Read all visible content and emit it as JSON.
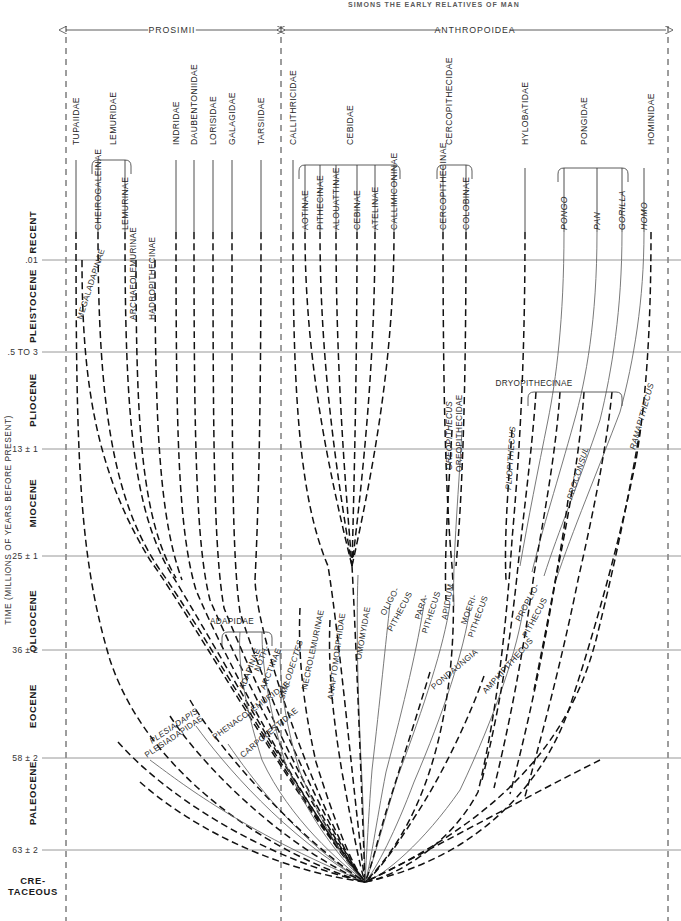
{
  "figure": {
    "running_head": "SIMONS  THE EARLY RELATIVES OF MAN",
    "axis_title": "TIME (MILLIONS OF YEARS BEFORE PRESENT)",
    "accent_color": "#1a1a1a",
    "extant_line_color": "#3a3a3a",
    "fossil_line_color": "#111111",
    "rule_color": "#8d8d8d"
  },
  "suborders": [
    {
      "name": "suborder-prosimii",
      "label": "PROSIMII",
      "x_start": 66,
      "x_end": 278,
      "label_x": 172
    },
    {
      "name": "suborder-anthropoidea",
      "label": "ANTHROPOIDEA",
      "x_start": 284,
      "x_end": 666,
      "label_x": 475
    }
  ],
  "epochs": [
    {
      "label": "RECENT",
      "y_top": 232,
      "y_bottom": 260,
      "text_y": 232
    },
    {
      "label": "PLEISTOCENE",
      "y_top": 260,
      "y_bottom": 352,
      "text_y": 306
    },
    {
      "label": "PLIOCENE",
      "y_top": 352,
      "y_bottom": 449,
      "text_y": 400
    },
    {
      "label": "MIOCENE",
      "y_top": 449,
      "y_bottom": 556,
      "text_y": 503
    },
    {
      "label": "OLIGOCENE",
      "y_top": 556,
      "y_bottom": 650,
      "text_y": 621
    },
    {
      "label": "EOCENE",
      "y_top": 650,
      "y_bottom": 758,
      "text_y": 706
    },
    {
      "label": "PALEOCENE",
      "y_top": 758,
      "y_bottom": 850,
      "text_y": 793
    },
    {
      "label": "CRE-\nTACEOUS",
      "y_top": 850,
      "y_bottom": 921,
      "text_y": 884
    }
  ],
  "ticks": [
    {
      "label": ".01",
      "y": 260
    },
    {
      "label": ".5 TO 3",
      "y": 352
    },
    {
      "label": "13 ± 1",
      "y": 449
    },
    {
      "label": "25 ± 1",
      "y": 556
    },
    {
      "label": "36 ± 2",
      "y": 650
    },
    {
      "label": "58 ± 2",
      "y": 758
    },
    {
      "label": "63 ± 2",
      "y": 850
    }
  ],
  "families": [
    {
      "label": "TUPAIIDAE",
      "x": 76,
      "text_y": 145,
      "line_y1": 232,
      "line_y2": 232
    },
    {
      "label": "LEMURIDAE",
      "x": 113,
      "text_y": 145
    },
    {
      "label": "INDRIDAE",
      "x": 176,
      "text_y": 145
    },
    {
      "label": "DAUBENTONIIDAE",
      "x": 194,
      "text_y": 145
    },
    {
      "label": "LORISIDAE",
      "x": 213,
      "text_y": 145
    },
    {
      "label": "GALAGIDAE",
      "x": 232,
      "text_y": 145
    },
    {
      "label": "TARSIIDAE",
      "x": 261,
      "text_y": 145
    },
    {
      "label": "CALLITHRICIDAE",
      "x": 293,
      "text_y": 145
    },
    {
      "label": "CEBIDAE",
      "x": 350,
      "text_y": 145
    },
    {
      "label": "CERCOPITHECIDAE",
      "x": 449,
      "text_y": 145
    },
    {
      "label": "HYLOBATIDAE",
      "x": 525,
      "text_y": 145
    },
    {
      "label": "PONGIDAE",
      "x": 584,
      "text_y": 145
    },
    {
      "label": "HOMINIDAE",
      "x": 651,
      "text_y": 145
    }
  ],
  "subfamilies": [
    {
      "label": "CHEIROGALEINAE",
      "x": 98,
      "text_y": 232,
      "top": 160
    },
    {
      "label": "LEMURINAE",
      "x": 125,
      "text_y": 232,
      "top": 160
    },
    {
      "label": "AOTINAE",
      "x": 305,
      "text_y": 232,
      "top": 165
    },
    {
      "label": "PITHECINAE",
      "x": 320,
      "text_y": 232,
      "top": 165
    },
    {
      "label": "ALOUATTINAE",
      "x": 336,
      "text_y": 232,
      "top": 165
    },
    {
      "label": "CEBINAE",
      "x": 357,
      "text_y": 232,
      "top": 165
    },
    {
      "label": "ATELINAE",
      "x": 375,
      "text_y": 232,
      "top": 165
    },
    {
      "label": "CALLIMICONINAE",
      "x": 394,
      "text_y": 232,
      "top": 165
    },
    {
      "label": "CERCOPITHECINAE",
      "x": 443,
      "text_y": 232,
      "top": 165
    },
    {
      "label": "COLOBINAE",
      "x": 466,
      "text_y": 232,
      "top": 165
    }
  ],
  "genera": [
    {
      "label": "PONGO",
      "x": 564,
      "text_y": 232,
      "top": 168
    },
    {
      "label": "PAN",
      "x": 597,
      "text_y": 232,
      "top": 168
    },
    {
      "label": "GORILLA",
      "x": 622,
      "text_y": 232,
      "top": 168
    },
    {
      "label": "HOMO",
      "x": 644,
      "text_y": 232,
      "top": 168
    }
  ],
  "fossil_taxa": [
    {
      "label": "MEGALADAPINAE",
      "italic": false,
      "x": 82,
      "y": 320,
      "rotate": -72
    },
    {
      "label": "ARCHAEOLEMURINAE",
      "italic": false,
      "x": 136,
      "y": 320,
      "rotate": -90
    },
    {
      "label": "HADROPITHECINAE",
      "italic": false,
      "x": 155,
      "y": 320,
      "rotate": -90
    },
    {
      "label": "ADAPIDAE",
      "italic": false,
      "x": 232,
      "y": 624,
      "rotate": 0
    },
    {
      "label": "ADAPINAE",
      "italic": false,
      "x": 244,
      "y": 690,
      "rotate": -68
    },
    {
      "label": "NOTH-",
      "italic": false,
      "x": 259,
      "y": 672,
      "rotate": -68
    },
    {
      "label": "ARCTINAE",
      "italic": false,
      "x": 265,
      "y": 690,
      "rotate": -68
    },
    {
      "label": "SMILODECTES",
      "italic": true,
      "x": 284,
      "y": 700,
      "rotate": -72
    },
    {
      "label": "NECROLEMURINAE",
      "italic": false,
      "x": 307,
      "y": 690,
      "rotate": -78
    },
    {
      "label": "ANAPTOMORPHIDAE",
      "italic": false,
      "x": 333,
      "y": 700,
      "rotate": -82
    },
    {
      "label": "OMOMYIDAE",
      "italic": false,
      "x": 361,
      "y": 660,
      "rotate": -80
    },
    {
      "label": "OLIGO-",
      "italic": false,
      "x": 385,
      "y": 616,
      "rotate": -62
    },
    {
      "label": "PITHECUS",
      "italic": false,
      "x": 392,
      "y": 632,
      "rotate": -62
    },
    {
      "label": "PARA-",
      "italic": false,
      "x": 420,
      "y": 620,
      "rotate": -72
    },
    {
      "label": "PITHECUS",
      "italic": false,
      "x": 427,
      "y": 634,
      "rotate": -72
    },
    {
      "label": "APIDIUM",
      "italic": false,
      "x": 447,
      "y": 620,
      "rotate": -80
    },
    {
      "label": "PONDAUNGIA",
      "italic": false,
      "x": 434,
      "y": 690,
      "rotate": -40
    },
    {
      "label": "MOERI-",
      "italic": false,
      "x": 466,
      "y": 625,
      "rotate": -70
    },
    {
      "label": "PITHECUS",
      "italic": false,
      "x": 473,
      "y": 638,
      "rotate": -70
    },
    {
      "label": "AMPHIPITHECUS",
      "italic": false,
      "x": 486,
      "y": 694,
      "rotate": -48
    },
    {
      "label": "PROPLIO-",
      "italic": false,
      "x": 520,
      "y": 622,
      "rotate": -62
    },
    {
      "label": "PITHECUS",
      "italic": false,
      "x": 527,
      "y": 638,
      "rotate": -62
    },
    {
      "label": "OREOPITHECUS",
      "italic": true,
      "x": 452,
      "y": 470,
      "rotate": -90
    },
    {
      "label": "OREOPITHECIDAE",
      "italic": false,
      "x": 462,
      "y": 472,
      "rotate": -90
    },
    {
      "label": "PLIOPITHECUS",
      "italic": true,
      "x": 511,
      "y": 490,
      "rotate": -86
    },
    {
      "label": "DRYOPITHECINAE",
      "italic": false,
      "x": 534,
      "y": 386,
      "rotate": 0
    },
    {
      "label": "PROCONSUL",
      "italic": true,
      "x": 572,
      "y": 500,
      "rotate": -72
    },
    {
      "label": "RAMAPITHECUS",
      "italic": true,
      "x": 635,
      "y": 450,
      "rotate": -74
    },
    {
      "label": "PHENACOLEMURIDAE",
      "italic": false,
      "x": 215,
      "y": 740,
      "rotate": -36
    },
    {
      "label": "CARPOLESTIDAE",
      "italic": false,
      "x": 243,
      "y": 758,
      "rotate": -40
    },
    {
      "label": "PLESIADAPIS",
      "italic": true,
      "x": 152,
      "y": 744,
      "rotate": -34
    },
    {
      "label": "PLESIADAPIDAE",
      "italic": false,
      "x": 147,
      "y": 758,
      "rotate": -34
    }
  ],
  "brackets": [
    {
      "name": "bracket-lemuridae",
      "x1": 92,
      "x2": 131,
      "y": 160
    },
    {
      "name": "bracket-cebidae",
      "x1": 299,
      "x2": 400,
      "y": 165
    },
    {
      "name": "bracket-cercopithecidae",
      "x1": 437,
      "x2": 472,
      "y": 165
    },
    {
      "name": "bracket-pongidae",
      "x1": 558,
      "x2": 628,
      "y": 168
    },
    {
      "name": "bracket-adapidae",
      "x1": 222,
      "x2": 272,
      "y": 632
    },
    {
      "name": "bracket-dryopithecinae",
      "x1": 528,
      "x2": 622,
      "y": 392
    }
  ]
}
